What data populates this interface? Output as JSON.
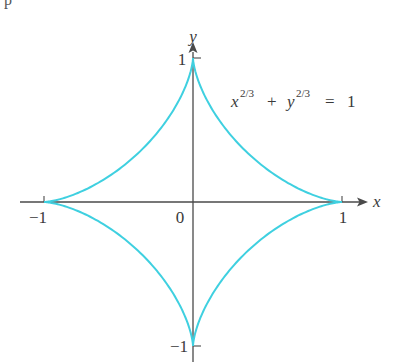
{
  "top_fragment": "p",
  "figure": {
    "title_equation": {
      "base_x": "x",
      "exp_x": "2/3",
      "plus": "+",
      "base_y": "y",
      "exp_y": "2/3",
      "equals": "=",
      "rhs": "1"
    },
    "axes": {
      "x_label": "x",
      "y_label": "y",
      "origin_label": "0",
      "x_ticks": [
        {
          "value": -1,
          "label": "−1"
        },
        {
          "value": 1,
          "label": "1"
        }
      ],
      "y_ticks": [
        {
          "value": 1,
          "label": "1"
        },
        {
          "value": -1,
          "label": "−1"
        }
      ]
    },
    "curve": {
      "name": "astroid",
      "equation": "x^(2/3) + y^(2/3) = 1",
      "color": "#3fd0e0",
      "cusps": [
        [
          1,
          0
        ],
        [
          0,
          1
        ],
        [
          -1,
          0
        ],
        [
          0,
          -1
        ]
      ]
    },
    "axis_color": "#4a4a4a"
  }
}
